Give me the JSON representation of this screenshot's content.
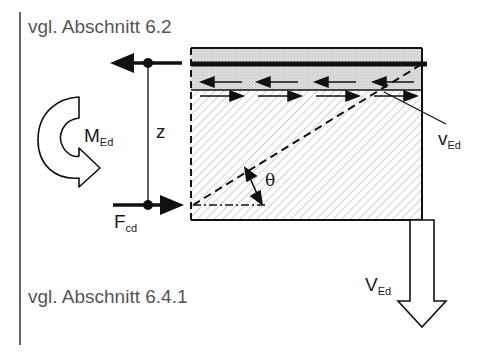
{
  "references": {
    "top": "vgl. Abschnitt 6.2",
    "bottom": "vgl. Abschnitt 6.4.1"
  },
  "labels": {
    "moment": {
      "main": "M",
      "sub": "Ed"
    },
    "lever_arm": "z",
    "compression_force": {
      "main": "F",
      "sub": "cd"
    },
    "shear_flow": {
      "main": "v",
      "sub": "Ed"
    },
    "shear_force": {
      "main": "V",
      "sub": "Ed"
    },
    "angle": "θ"
  },
  "colors": {
    "line": "#111111",
    "reference_text": "#555555",
    "flange_fill": "#d9d9d9",
    "hatch": "#c8c8c8"
  }
}
